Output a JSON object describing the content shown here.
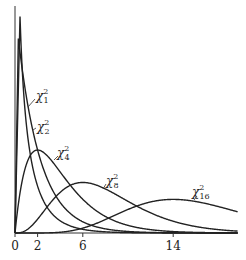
{
  "chart_data": {
    "type": "line",
    "title": "",
    "xlabel": "",
    "ylabel": "",
    "xlim": [
      0,
      19.7
    ],
    "x_ticks": [
      "0",
      "2",
      "6",
      "14"
    ],
    "x_tick_values": [
      0,
      2,
      6,
      14
    ],
    "grid": false,
    "series": [
      {
        "name": "χ²₁",
        "df": 1,
        "label_sub": "1",
        "mode": 0
      },
      {
        "name": "χ²₂",
        "df": 2,
        "label_sub": "2",
        "mode": 0
      },
      {
        "name": "χ²₄",
        "df": 4,
        "label_sub": "4",
        "mode": 2
      },
      {
        "name": "χ²₈",
        "df": 8,
        "label_sub": "8",
        "mode": 6
      },
      {
        "name": "χ²₁₆",
        "df": 16,
        "label_sub": "16",
        "mode": 14
      }
    ],
    "annotations": [
      "χ²₁",
      "χ²₂",
      "χ²₄",
      "χ²₈",
      "χ²₁₆"
    ]
  },
  "labels": {
    "chi": "χ",
    "sup": "2",
    "s1": "1",
    "s2": "2",
    "s4": "4",
    "s8": "8",
    "s16": "16"
  },
  "ticks": {
    "t0": "0",
    "t2": "2",
    "t6": "6",
    "t14": "14"
  }
}
